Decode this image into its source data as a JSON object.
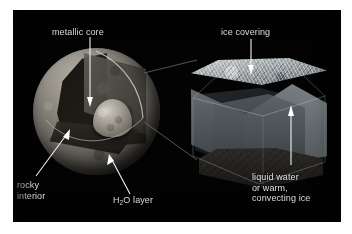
{
  "figure": {
    "background_color": "#030303",
    "page_color": "#ffffff",
    "label_color": "#e2e2e2",
    "leader_color": "#f2f2f2",
    "connector_color": "#6a6a6a"
  },
  "labels": {
    "metallic_core": "metallic core",
    "rocky_interior_line1": "rocky",
    "rocky_interior_line2": "interior",
    "h2o_layer_pre": "H",
    "h2o_layer_sub": "2",
    "h2o_layer_post": "O layer",
    "ice_covering": "ice covering",
    "liquid_line1": "liquid water",
    "liquid_line2": "or warm,",
    "liquid_line3": "convecting ice"
  },
  "diagram_parts": {
    "sphere": {
      "name": "cutaway planetary body",
      "layers": [
        "H2O layer shell",
        "rocky interior",
        "metallic core"
      ]
    },
    "cube": {
      "name": "crustal block detail",
      "layers": [
        "ice covering",
        "liquid water or warm convecting ice",
        "rocky floor"
      ]
    }
  }
}
